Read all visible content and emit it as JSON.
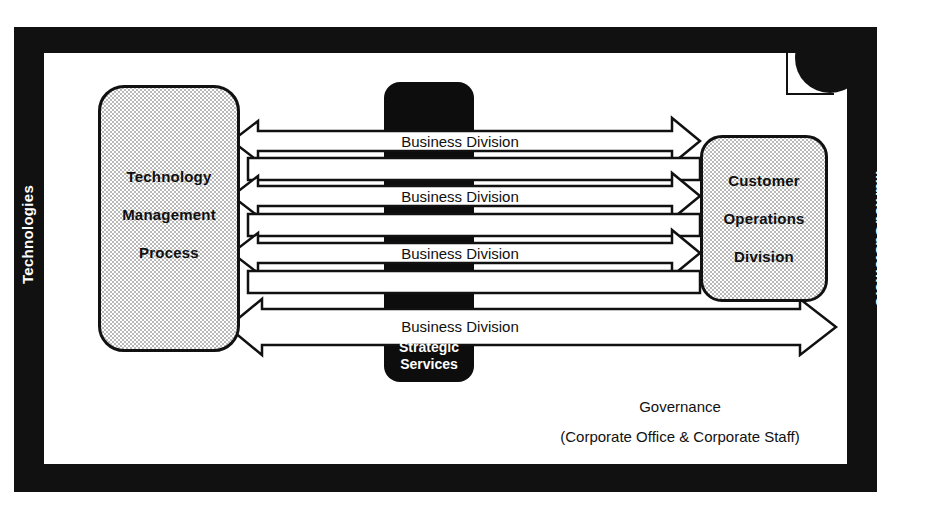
{
  "frame": {
    "left_band_label": "Technologies",
    "right_band_label": "Market/Customers"
  },
  "left_entity": {
    "name": "technology-management-process",
    "lines": [
      "Technology",
      "Management",
      "Process"
    ]
  },
  "right_entity": {
    "name": "customer-operations-division",
    "lines": [
      "Customer",
      "Operations",
      "Division"
    ]
  },
  "center_entity": {
    "name": "strategic-services",
    "lines": [
      "Strategic",
      "Services"
    ]
  },
  "arrows": [
    {
      "label": "Business Division"
    },
    {
      "label": "Business Division"
    },
    {
      "label": "Business Division"
    },
    {
      "label": "Business Division"
    }
  ],
  "governance": {
    "title": "Governance",
    "subtitle": "(Corporate Office & Corporate Staff)"
  },
  "colors": {
    "frame": "#111111",
    "paper": "#ffffff",
    "entity_fill": "#b9b9b9",
    "center_fill": "#0d0d0d",
    "text": "#111111",
    "inverse_text": "#ffffff"
  }
}
